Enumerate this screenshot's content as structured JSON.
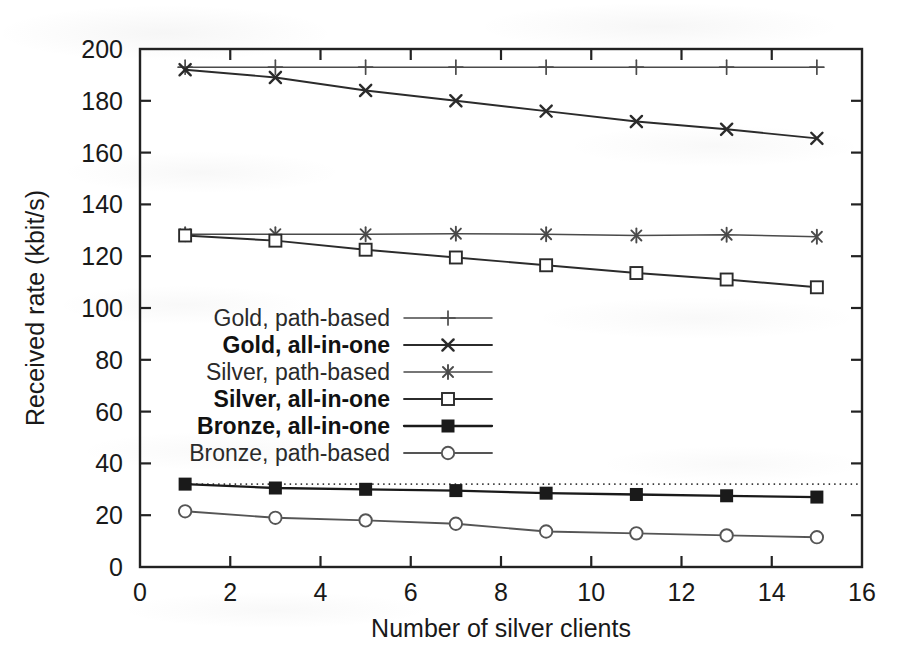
{
  "chart_data": {
    "type": "line",
    "title": "",
    "xlabel": "Number of silver clients",
    "ylabel": "Received rate (kbit/s)",
    "xlim": [
      0,
      16
    ],
    "ylim": [
      0,
      200
    ],
    "xticks": [
      0,
      2,
      4,
      6,
      8,
      10,
      12,
      14,
      16
    ],
    "yticks": [
      0,
      20,
      40,
      60,
      80,
      100,
      120,
      140,
      160,
      180,
      200
    ],
    "grid": false,
    "legend_position": "center-left inside axes",
    "x": [
      1,
      3,
      5,
      7,
      9,
      11,
      13,
      15
    ],
    "series": [
      {
        "name": "Gold, path-based",
        "marker": "plus",
        "color": "#4a4a4a",
        "values": [
          193,
          193,
          193,
          193,
          193,
          193,
          193,
          193
        ]
      },
      {
        "name": "Gold, all-in-one",
        "marker": "cross",
        "color": "#2b2b2b",
        "values": [
          192,
          189,
          184,
          180,
          176,
          172,
          169,
          165.5
        ]
      },
      {
        "name": "Silver, path-based",
        "marker": "asterisk",
        "color": "#4a4a4a",
        "values": [
          128.5,
          128.5,
          128.5,
          128.7,
          128.5,
          128,
          128.3,
          127.5
        ]
      },
      {
        "name": "Silver, all-in-one",
        "marker": "open-square",
        "color": "#2b2b2b",
        "values": [
          128,
          126,
          122.5,
          119.5,
          116.5,
          113.5,
          111,
          108
        ]
      },
      {
        "name": "Bronze, all-in-one",
        "marker": "filled-square",
        "color": "#1a1a1a",
        "values": [
          32,
          30.5,
          30,
          29.5,
          28.5,
          28,
          27.5,
          27
        ]
      },
      {
        "name": "Bronze, path-based",
        "marker": "open-circle",
        "color": "#555555",
        "values": [
          21.5,
          19,
          18,
          16.7,
          13.7,
          13,
          12.2,
          11.5
        ]
      }
    ],
    "reference_line": {
      "name": "bronze-path-based-reference",
      "style": "dotted",
      "value": 32
    }
  }
}
